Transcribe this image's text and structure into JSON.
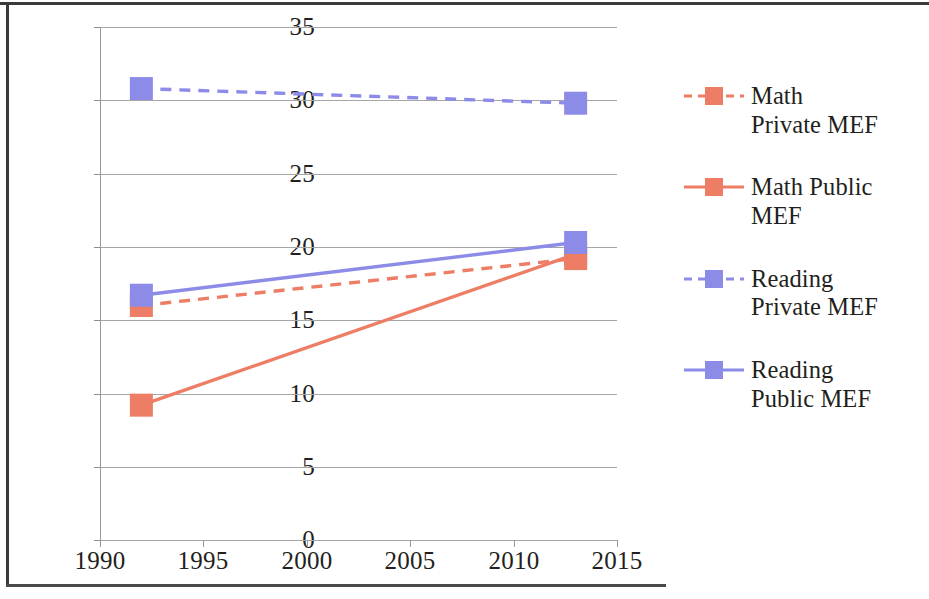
{
  "chart_data": {
    "type": "line",
    "title": "",
    "subtitle": "",
    "xlabel": "",
    "ylabel": "",
    "xlim": [
      1990,
      2015
    ],
    "ylim": [
      0,
      35
    ],
    "xticks": [
      1990,
      1995,
      2000,
      2005,
      2010,
      2015
    ],
    "yticks": [
      0,
      5,
      10,
      15,
      20,
      25,
      30,
      35
    ],
    "grid": true,
    "legend_position": "right",
    "x": [
      1992,
      2013
    ],
    "series": [
      {
        "name": "Math Private MEF",
        "values": [
          16.0,
          19.2
        ],
        "color": "#ED7D64",
        "style": "dashed",
        "marker": "square"
      },
      {
        "name": "Math Public MEF",
        "values": [
          9.2,
          19.5
        ],
        "color": "#ED7D64",
        "style": "solid",
        "marker": "square"
      },
      {
        "name": "Reading Private MEF",
        "values": [
          30.8,
          29.8
        ],
        "color": "#8C8CE8",
        "style": "dashed",
        "marker": "square"
      },
      {
        "name": "Reading Public MEF",
        "values": [
          16.7,
          20.3
        ],
        "color": "#8C8CE8",
        "style": "solid",
        "marker": "square"
      }
    ]
  },
  "axes": {
    "y_tick_labels": [
      "35",
      "30",
      "25",
      "20",
      "15",
      "10",
      "5",
      "0"
    ],
    "x_tick_labels": [
      "1990",
      "1995",
      "2000",
      "2005",
      "2010",
      "2015"
    ]
  },
  "legend": {
    "items": [
      {
        "label_line1": "Math",
        "label_line2": "Private MEF",
        "color": "#ED7D64",
        "style": "dashed"
      },
      {
        "label_line1": "Math Public",
        "label_line2": "MEF",
        "color": "#ED7D64",
        "style": "solid"
      },
      {
        "label_line1": "Reading",
        "label_line2": "Private MEF",
        "color": "#8C8CE8",
        "style": "dashed"
      },
      {
        "label_line1": "Reading",
        "label_line2": "Public MEF",
        "color": "#8C8CE8",
        "style": "solid"
      }
    ]
  },
  "colors": {
    "red": "#ED7D64",
    "blue": "#8C8CE8",
    "grid": "#a6a6a6",
    "text": "#231f20",
    "frame": "#3a3a3a"
  }
}
